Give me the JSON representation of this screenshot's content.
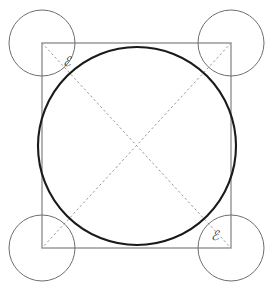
{
  "figure": {
    "domain": "Diagram",
    "canvas": {
      "width": 274,
      "height": 295,
      "background": "#ffffff"
    },
    "colors": {
      "big_circle_stroke": "#1a1a1a",
      "square_stroke": "#757575",
      "small_circle_stroke": "#6e6e6e",
      "diagonal_stroke": "#9a9a9a",
      "label_color": "#3a3a3a",
      "background": "#ffffff"
    },
    "square": {
      "name": "square",
      "x": 42,
      "y": 43,
      "width": 189,
      "height": 205,
      "stroke_width": 1.1,
      "corners": [
        {
          "id": "top-left",
          "cx": 42,
          "cy": 43
        },
        {
          "id": "top-right",
          "cx": 231,
          "cy": 43
        },
        {
          "id": "bottom-right",
          "cx": 231,
          "cy": 248
        },
        {
          "id": "bottom-left",
          "cx": 42,
          "cy": 248
        }
      ]
    },
    "big_circle": {
      "name": "big-circle",
      "cx": 137,
      "cy": 146,
      "r": 99,
      "stroke_width": 2.1
    },
    "small_circles": [
      {
        "id": "small-circle-top-left",
        "cx": 42,
        "cy": 43,
        "r": 33,
        "stroke_width": 1.0
      },
      {
        "id": "small-circle-top-right",
        "cx": 231,
        "cy": 43,
        "r": 33,
        "stroke_width": 1.0
      },
      {
        "id": "small-circle-bottom-right",
        "cx": 231,
        "cy": 248,
        "r": 33,
        "stroke_width": 1.0
      },
      {
        "id": "small-circle-bottom-left",
        "cx": 42,
        "cy": 248,
        "r": 33,
        "stroke_width": 1.0
      }
    ],
    "diagonals": [
      {
        "id": "diagonal-tl-br",
        "x1": 42,
        "y1": 43,
        "x2": 231,
        "y2": 248,
        "dash": "1.6 3.2",
        "stroke_width": 1.0
      },
      {
        "id": "diagonal-tr-bl",
        "x1": 231,
        "y1": 43,
        "x2": 42,
        "y2": 248,
        "dash": "1.6 3.2",
        "stroke_width": 1.0
      }
    ],
    "labels": [
      {
        "id": "label-epsilon-top-left",
        "text": "ℰ",
        "x": 63,
        "y": 66,
        "font_size": 13
      },
      {
        "id": "label-epsilon-bottom-right",
        "text": "ℰ",
        "x": 211,
        "y": 240,
        "font_size": 13
      }
    ]
  }
}
